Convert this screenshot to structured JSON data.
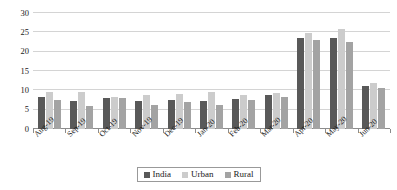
{
  "chart_data": {
    "type": "bar",
    "title": "",
    "subtitle": "",
    "xlabel": "",
    "ylabel": "",
    "ylim": [
      0,
      30
    ],
    "yticks": [
      0,
      5,
      10,
      15,
      20,
      25,
      30
    ],
    "grid": true,
    "legend_position": "bottom",
    "categories": [
      "Aug-19",
      "Sep-19",
      "Oct-19",
      "Nov-19",
      "Dec-19",
      "Jan-20",
      "Feb-20",
      "Mar-20",
      "Apr-20",
      "May-20",
      "Jun-20"
    ],
    "series": [
      {
        "name": "India",
        "color": "#595959",
        "values": [
          8.3,
          7.2,
          8.1,
          7.2,
          7.6,
          7.2,
          7.8,
          8.8,
          23.5,
          23.5,
          11.0
        ]
      },
      {
        "name": "Urban",
        "color": "#cccccc",
        "values": [
          9.7,
          9.6,
          8.3,
          8.8,
          9.0,
          9.7,
          8.7,
          9.4,
          24.9,
          25.8,
          12.0
        ]
      },
      {
        "name": "Rural",
        "color": "#a3a3a3",
        "values": [
          7.5,
          6.0,
          8.1,
          6.3,
          6.9,
          6.3,
          7.4,
          8.4,
          22.9,
          22.5,
          10.5
        ]
      }
    ]
  },
  "legend": {
    "items": [
      {
        "label": "India",
        "color": "#595959",
        "swatch": "legend-swatch-india"
      },
      {
        "label": "Urban",
        "color": "#cccccc",
        "swatch": "legend-swatch-urban"
      },
      {
        "label": "Rural",
        "color": "#a3a3a3",
        "swatch": "legend-swatch-rural"
      }
    ]
  }
}
